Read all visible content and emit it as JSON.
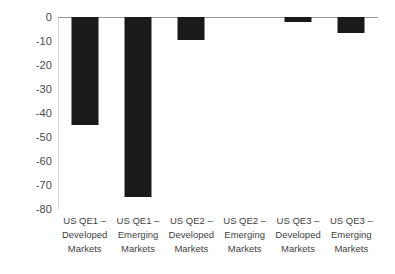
{
  "chart_data": {
    "type": "bar",
    "title": "",
    "subtitle": "",
    "xlabel": "",
    "ylabel": "",
    "categories": [
      "US QE1 –\nDeveloped\nMarkets",
      "US QE1 –\nEmerging\nMarkets",
      "US QE2 –\nDeveloped\nMarkets",
      "US QE2 –\nEmerging\nMarkets",
      "US QE3 –\nDeveloped\nMarkets",
      "US QE3 –\nEmerging\nMarkets"
    ],
    "values": [
      -45,
      -75,
      -9.5,
      0,
      -2,
      -6.5
    ],
    "ylim": [
      -80,
      0
    ],
    "yticks": [
      0,
      -10,
      -20,
      -30,
      -40,
      -50,
      -60,
      -70,
      -80
    ],
    "ytick_labels": [
      "0",
      "-10",
      "-20",
      "-30",
      "-40",
      "-50",
      "-60",
      "-70",
      "-80"
    ],
    "grid": false,
    "legend": null,
    "bar_color": "#1a1a1a",
    "axis_color": "#9a9a9a"
  }
}
